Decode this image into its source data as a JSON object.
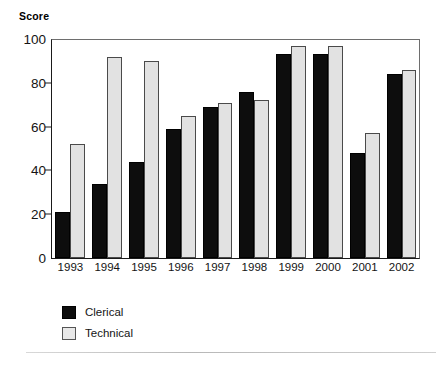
{
  "chart_data": {
    "type": "bar",
    "title": "",
    "ylabel": "Score",
    "xlabel": "",
    "categories": [
      "1993",
      "1994",
      "1995",
      "1996",
      "1997",
      "1998",
      "1999",
      "2000",
      "2001",
      "2002"
    ],
    "series": [
      {
        "name": "Clerical",
        "color": "#0d0d0d",
        "values": [
          21,
          34,
          44,
          59,
          69,
          76,
          93,
          93,
          48,
          84
        ]
      },
      {
        "name": "Technical",
        "color": "#e2e2e2",
        "values": [
          52,
          92,
          90,
          65,
          71,
          72,
          97,
          97,
          57,
          86
        ]
      }
    ],
    "ylim": [
      0,
      100
    ],
    "yticks": [
      0,
      20,
      40,
      60,
      80,
      100
    ],
    "ytick_labels": [
      "0",
      "20",
      "40",
      "60",
      "80",
      "100"
    ],
    "grid": false,
    "legend_position": "below-left"
  },
  "legend": {
    "items": [
      {
        "label": "Clerical",
        "swatch": "black-square-icon"
      },
      {
        "label": "Technical",
        "swatch": "light-square-icon"
      }
    ]
  }
}
